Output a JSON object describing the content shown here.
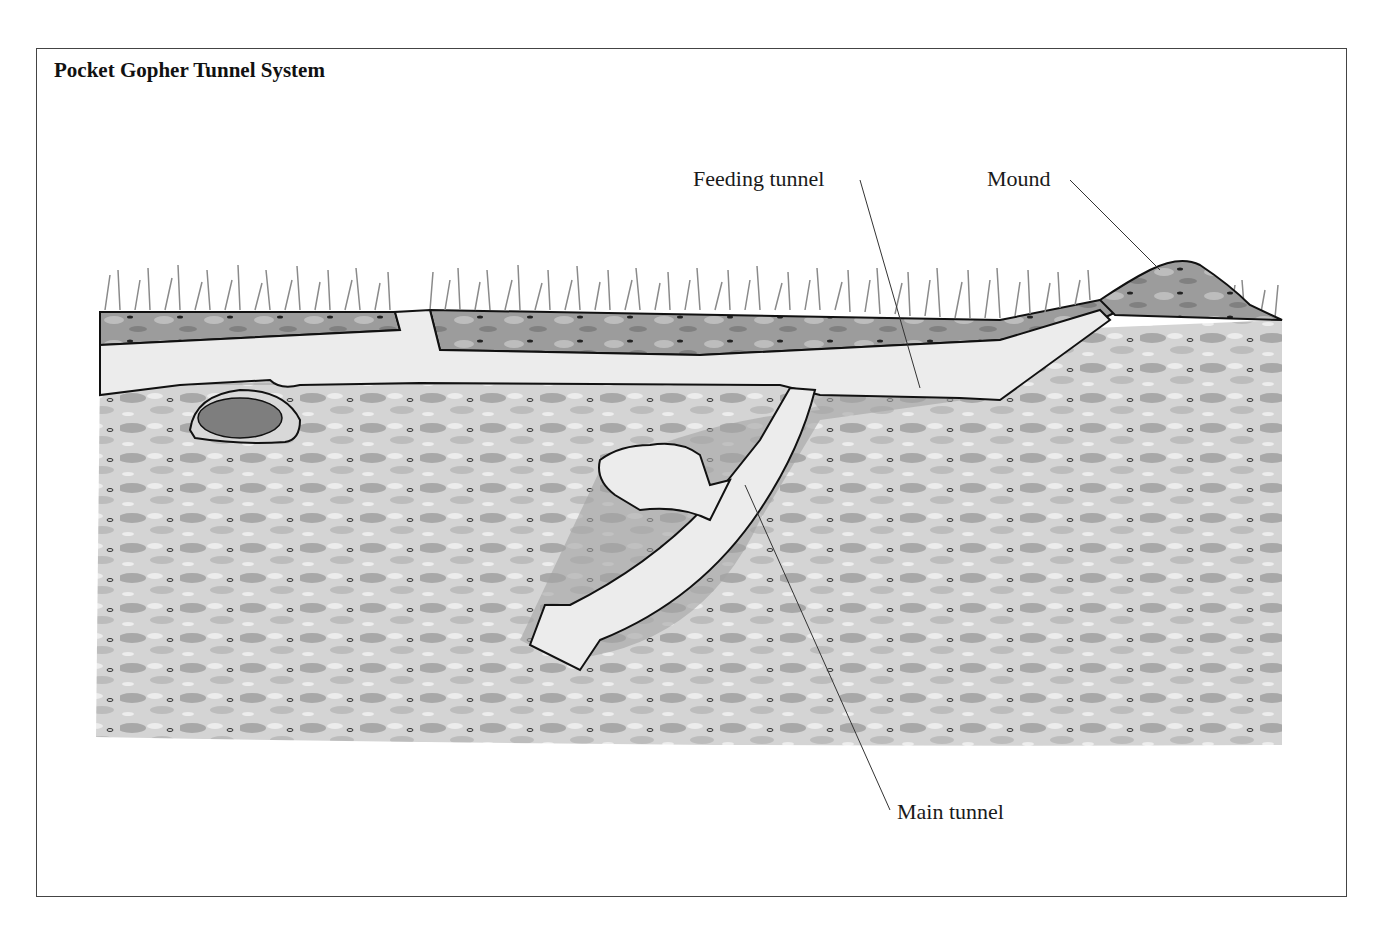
{
  "figure": {
    "title": "Pocket Gopher Tunnel System",
    "labels": {
      "feeding_tunnel": "Feeding tunnel",
      "mound": "Mound",
      "main_tunnel": "Main tunnel"
    },
    "elements": [
      "grass",
      "topsoil",
      "subsoil",
      "main-tunnel",
      "feeding-tunnel",
      "mound",
      "nest-chamber",
      "side-chamber",
      "gopher"
    ],
    "colors": {
      "background": "#ffffff",
      "soil_light": "#d6d6d6",
      "soil_dark": "#9a9a9a",
      "tunnel": "#ececec",
      "outline": "#1a1a1a"
    }
  }
}
